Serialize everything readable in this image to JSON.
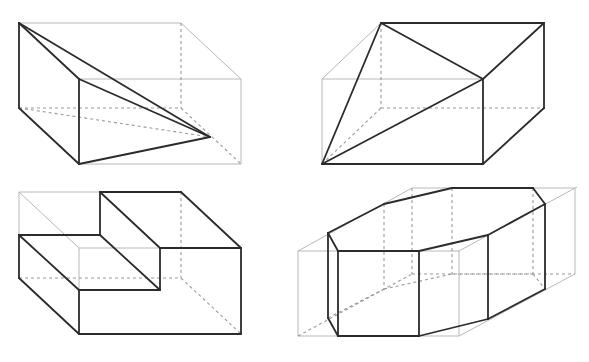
{
  "diagram": {
    "title": "",
    "colors": {
      "heavy_edge": "#2b2b2b",
      "light_edge": "#b8b8b8",
      "hidden_edge": "#9a9a9a",
      "background": "#ffffff"
    },
    "figures": [
      {
        "id": "fig-top-left",
        "name": "tetrahedron-in-box-a",
        "box": {
          "back_top_left": [
            19,
            23
          ],
          "back_top_right": [
            181,
            23
          ],
          "back_bottom_left": [
            19,
            108
          ],
          "back_bottom_right": [
            181,
            108
          ],
          "front_top_left": [
            79,
            79
          ],
          "front_top_right": [
            241,
            79
          ],
          "front_bottom_left": [
            79,
            164
          ],
          "front_bottom_right": [
            241,
            164
          ]
        },
        "apex": [
          210,
          137
        ],
        "heavy_edges": [
          [
            [
              19,
              23
            ],
            [
              19,
              108
            ]
          ],
          [
            [
              19,
              108
            ],
            [
              79,
              164
            ]
          ],
          [
            [
              79,
              79
            ],
            [
              79,
              164
            ]
          ],
          [
            [
              19,
              23
            ],
            [
              79,
              79
            ]
          ],
          [
            [
              19,
              23
            ],
            [
              210,
              137
            ]
          ],
          [
            [
              79,
              79
            ],
            [
              210,
              137
            ]
          ],
          [
            [
              79,
              164
            ],
            [
              210,
              137
            ]
          ]
        ],
        "light_edges": [
          [
            [
              19,
              23
            ],
            [
              181,
              23
            ]
          ],
          [
            [
              181,
              23
            ],
            [
              241,
              79
            ]
          ],
          [
            [
              79,
              79
            ],
            [
              241,
              79
            ]
          ],
          [
            [
              241,
              79
            ],
            [
              241,
              164
            ]
          ],
          [
            [
              79,
              164
            ],
            [
              241,
              164
            ]
          ]
        ],
        "hidden_edges": [
          [
            [
              181,
              23
            ],
            [
              181,
              108
            ]
          ],
          [
            [
              19,
              108
            ],
            [
              181,
              108
            ]
          ],
          [
            [
              181,
              108
            ],
            [
              241,
              164
            ]
          ],
          [
            [
              19,
              108
            ],
            [
              210,
              137
            ]
          ]
        ]
      },
      {
        "id": "fig-top-right",
        "name": "tetrahedron-in-box-b",
        "box": {
          "back_top_left": [
            381,
            23
          ],
          "back_top_right": [
            544,
            23
          ],
          "back_bottom_left": [
            381,
            108
          ],
          "back_bottom_right": [
            544,
            108
          ],
          "front_top_left": [
            322,
            79
          ],
          "front_top_right": [
            483,
            79
          ],
          "front_bottom_left": [
            322,
            164
          ],
          "front_bottom_right": [
            483,
            164
          ]
        },
        "heavy_edges": [
          [
            [
              381,
              23
            ],
            [
              544,
              23
            ]
          ],
          [
            [
              544,
              23
            ],
            [
              483,
              79
            ]
          ],
          [
            [
              381,
              23
            ],
            [
              483,
              79
            ]
          ],
          [
            [
              544,
              23
            ],
            [
              544,
              108
            ]
          ],
          [
            [
              544,
              108
            ],
            [
              483,
              164
            ]
          ],
          [
            [
              483,
              79
            ],
            [
              483,
              164
            ]
          ],
          [
            [
              322,
              164
            ],
            [
              483,
              164
            ]
          ],
          [
            [
              322,
              164
            ],
            [
              381,
              23
            ]
          ],
          [
            [
              322,
              164
            ],
            [
              483,
              79
            ]
          ]
        ],
        "light_edges": [
          [
            [
              322,
              79
            ],
            [
              381,
              23
            ]
          ],
          [
            [
              322,
              79
            ],
            [
              483,
              79
            ]
          ],
          [
            [
              322,
              79
            ],
            [
              322,
              164
            ]
          ]
        ],
        "hidden_edges": [
          [
            [
              381,
              23
            ],
            [
              381,
              108
            ]
          ],
          [
            [
              381,
              108
            ],
            [
              544,
              108
            ]
          ],
          [
            [
              322,
              164
            ],
            [
              381,
              108
            ]
          ]
        ]
      },
      {
        "id": "fig-bottom-left",
        "name": "stepped-block",
        "heavy_edges": [
          [
            [
              100,
              192
            ],
            [
              181,
              192
            ]
          ],
          [
            [
              181,
              192
            ],
            [
              241,
              248
            ]
          ],
          [
            [
              100,
              192
            ],
            [
              100,
              235
            ]
          ],
          [
            [
              100,
              192
            ],
            [
              160,
              248
            ]
          ],
          [
            [
              19,
              235
            ],
            [
              100,
              235
            ]
          ],
          [
            [
              19,
              235
            ],
            [
              79,
              290
            ]
          ],
          [
            [
              100,
              235
            ],
            [
              160,
              290
            ]
          ],
          [
            [
              160,
              248
            ],
            [
              241,
              248
            ]
          ],
          [
            [
              160,
              248
            ],
            [
              160,
              290
            ]
          ],
          [
            [
              79,
              290
            ],
            [
              160,
              290
            ]
          ],
          [
            [
              19,
              235
            ],
            [
              19,
              278
            ]
          ],
          [
            [
              19,
              278
            ],
            [
              79,
              334
            ]
          ],
          [
            [
              79,
              290
            ],
            [
              79,
              334
            ]
          ],
          [
            [
              79,
              334
            ],
            [
              241,
              334
            ]
          ],
          [
            [
              241,
              248
            ],
            [
              241,
              334
            ]
          ]
        ],
        "light_edges": [
          [
            [
              19,
              192
            ],
            [
              100,
              192
            ]
          ],
          [
            [
              19,
              192
            ],
            [
              19,
              235
            ]
          ],
          [
            [
              19,
              192
            ],
            [
              79,
              248
            ]
          ],
          [
            [
              79,
              248
            ],
            [
              160,
              248
            ]
          ],
          [
            [
              79,
              248
            ],
            [
              79,
              290
            ]
          ]
        ],
        "hidden_edges": [
          [
            [
              181,
              192
            ],
            [
              181,
              278
            ]
          ],
          [
            [
              19,
              278
            ],
            [
              181,
              278
            ]
          ],
          [
            [
              181,
              278
            ],
            [
              241,
              334
            ]
          ]
        ]
      },
      {
        "id": "fig-bottom-right",
        "name": "octagonal-prism-in-box",
        "top_face": [
          [
            328,
            233
          ],
          [
            338,
            251
          ],
          [
            419,
            251
          ],
          [
            488,
            235
          ],
          [
            545,
            204
          ],
          [
            533,
            188
          ],
          [
            452,
            188
          ],
          [
            384,
            204
          ]
        ],
        "bottom_face": [
          [
            328,
            318
          ],
          [
            338,
            336
          ],
          [
            419,
            336
          ],
          [
            488,
            319
          ],
          [
            545,
            289
          ],
          [
            533,
            274
          ],
          [
            452,
            274
          ],
          [
            384,
            289
          ]
        ],
        "bounding_box": {
          "front_top_left": [
            298,
            251
          ],
          "front_top_right": [
            459,
            251
          ],
          "front_bottom_left": [
            298,
            336
          ],
          "front_bottom_right": [
            459,
            336
          ],
          "back_top_left": [
            412,
            188
          ],
          "back_top_right": [
            575,
            188
          ],
          "back_bottom_left": [
            412,
            274
          ],
          "back_bottom_right": [
            575,
            274
          ]
        }
      }
    ]
  }
}
